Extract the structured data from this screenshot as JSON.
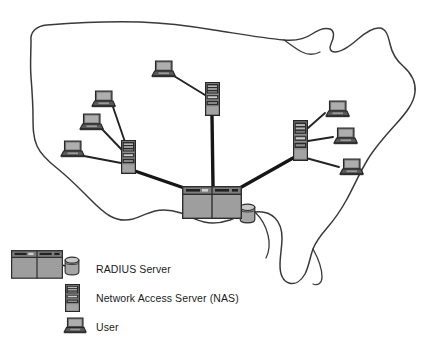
{
  "diagram": {
    "map": {
      "name": "united-states-outline",
      "stroke_color": "#3a3a3a",
      "fill_color": "#ffffff",
      "stroke_width": 1.4
    },
    "colors": {
      "server_body": "#9e9e9e",
      "server_outline": "#333333",
      "server_header": "#5a5a5a",
      "nas_dark": "#2b2b2b",
      "nas_mid": "#6e6e6e",
      "nas_light": "#a8a8a8",
      "laptop_screen": "#8c8c8c",
      "laptop_base": "#4a4a4a",
      "cylinder_fill": "#a5a5a5",
      "link_trunk": "#1a1a1a",
      "link_edge": "#2a2a2a",
      "text": "#1b1b1b"
    },
    "nodes": [
      {
        "id": "radius-server-central",
        "type": "radius-server",
        "x": 182,
        "y": 186,
        "w": 60,
        "h": 33
      },
      {
        "id": "radius-database-central",
        "type": "database-cylinder",
        "x": 239,
        "y": 203,
        "w": 17,
        "h": 21
      },
      {
        "id": "nas-left",
        "type": "nas",
        "x": 121,
        "y": 140,
        "w": 15,
        "h": 34
      },
      {
        "id": "nas-middle",
        "type": "nas",
        "x": 205,
        "y": 82,
        "w": 15,
        "h": 34
      },
      {
        "id": "nas-right",
        "type": "nas",
        "x": 293,
        "y": 120,
        "w": 15,
        "h": 41
      },
      {
        "id": "user-left-top",
        "type": "laptop",
        "x": 91,
        "y": 90,
        "w": 25,
        "h": 18
      },
      {
        "id": "user-left-mid",
        "type": "laptop",
        "x": 79,
        "y": 113,
        "w": 25,
        "h": 18
      },
      {
        "id": "user-left-bottom",
        "type": "laptop",
        "x": 60,
        "y": 140,
        "w": 25,
        "h": 18
      },
      {
        "id": "user-middle-top",
        "type": "laptop",
        "x": 151,
        "y": 60,
        "w": 25,
        "h": 18
      },
      {
        "id": "user-right-top",
        "type": "laptop",
        "x": 325,
        "y": 100,
        "w": 25,
        "h": 18
      },
      {
        "id": "user-right-mid",
        "type": "laptop",
        "x": 333,
        "y": 127,
        "w": 25,
        "h": 18
      },
      {
        "id": "user-right-bottom",
        "type": "laptop",
        "x": 339,
        "y": 158,
        "w": 25,
        "h": 18
      }
    ],
    "links": [
      {
        "from": "nas-left",
        "to": "radius-server-central",
        "weight": "trunk"
      },
      {
        "from": "nas-middle",
        "to": "radius-server-central",
        "weight": "trunk"
      },
      {
        "from": "nas-right",
        "to": "radius-server-central",
        "weight": "trunk"
      },
      {
        "from": "user-left-top",
        "to": "nas-left",
        "weight": "edge"
      },
      {
        "from": "user-left-mid",
        "to": "nas-left",
        "weight": "edge"
      },
      {
        "from": "user-left-bottom",
        "to": "nas-left",
        "weight": "edge"
      },
      {
        "from": "user-middle-top",
        "to": "nas-middle",
        "weight": "edge"
      },
      {
        "from": "user-right-top",
        "to": "nas-right",
        "weight": "edge"
      },
      {
        "from": "user-right-mid",
        "to": "nas-right",
        "weight": "edge"
      },
      {
        "from": "user-right-bottom",
        "to": "nas-right",
        "weight": "edge"
      },
      {
        "from": "radius-server-central",
        "to": "radius-database-central",
        "weight": "edge"
      }
    ]
  },
  "legend": {
    "items": [
      {
        "key": "radius",
        "icon": "radius-server-icon",
        "label": "RADIUS Server"
      },
      {
        "key": "nas",
        "icon": "nas-icon",
        "label": "Network Access Server (NAS)"
      },
      {
        "key": "user",
        "icon": "laptop-icon",
        "label": "User"
      }
    ]
  }
}
